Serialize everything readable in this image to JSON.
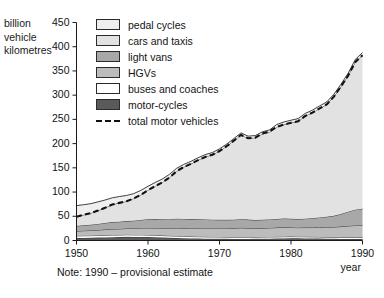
{
  "axis": {
    "y_label": "billion\nvehicle\nkilometres",
    "x_label": "year",
    "y_ticks": [
      "0",
      "50",
      "100",
      "150",
      "200",
      "250",
      "300",
      "350",
      "400",
      "450"
    ],
    "x_ticks": [
      "1950",
      "1960",
      "1970",
      "1980",
      "1990"
    ]
  },
  "note": "Note: 1990 – provisional estimate",
  "legend": {
    "items": [
      {
        "label": "pedal cycles",
        "color": "#efefef",
        "type": "swatch"
      },
      {
        "label": "cars and taxis",
        "color": "#e2e2e2",
        "type": "swatch"
      },
      {
        "label": "light vans",
        "color": "#a8a8a8",
        "type": "swatch"
      },
      {
        "label": "HGVs",
        "color": "#bcbcbc",
        "type": "swatch"
      },
      {
        "label": "buses and coaches",
        "color": "#ffffff",
        "type": "swatch"
      },
      {
        "label": "motor-cycles",
        "color": "#5a5a5a",
        "type": "swatch"
      },
      {
        "label": "total motor vehicles",
        "color": "#111111",
        "type": "dashed-line"
      }
    ]
  },
  "chart_data": {
    "type": "area",
    "title": "",
    "xlabel": "year",
    "ylabel": "billion vehicle kilometres",
    "xlim": [
      1950,
      1990
    ],
    "ylim": [
      0,
      450
    ],
    "grid": false,
    "legend_position": "top-left-inside",
    "stacking": "stacked-from-bottom",
    "stack_order_bottom_to_top": [
      "motor-cycles",
      "buses and coaches",
      "HGVs",
      "light vans",
      "cars and taxis",
      "pedal cycles"
    ],
    "x": [
      1950,
      1951,
      1952,
      1953,
      1954,
      1955,
      1956,
      1957,
      1958,
      1959,
      1960,
      1961,
      1962,
      1963,
      1964,
      1965,
      1966,
      1967,
      1968,
      1969,
      1970,
      1971,
      1972,
      1973,
      1974,
      1975,
      1976,
      1977,
      1978,
      1979,
      1980,
      1981,
      1982,
      1983,
      1984,
      1985,
      1986,
      1987,
      1988,
      1989,
      1990
    ],
    "series": [
      {
        "name": "motor-cycles",
        "color": "#5a5a5a",
        "values": [
          5.0,
          5.3,
          5.6,
          6.0,
          6.4,
          6.9,
          7.0,
          7.6,
          7.4,
          7.4,
          7.2,
          6.8,
          6.2,
          5.6,
          5.2,
          4.6,
          4.2,
          4.0,
          3.8,
          3.6,
          3.5,
          3.4,
          3.3,
          3.3,
          3.3,
          3.4,
          3.6,
          3.8,
          4.0,
          4.2,
          4.4,
          4.4,
          4.3,
          4.1,
          3.9,
          3.6,
          3.4,
          3.2,
          3.1,
          3.0,
          3.0
        ]
      },
      {
        "name": "buses and coaches",
        "color": "#ffffff",
        "values": [
          4.5,
          4.5,
          4.4,
          4.4,
          4.4,
          4.4,
          4.3,
          4.3,
          4.2,
          4.2,
          4.1,
          4.1,
          4.0,
          4.0,
          4.0,
          3.9,
          3.9,
          3.9,
          3.8,
          3.8,
          3.8,
          3.7,
          3.7,
          3.6,
          3.6,
          3.6,
          3.6,
          3.6,
          3.6,
          3.6,
          3.6,
          3.5,
          3.4,
          3.4,
          3.4,
          3.4,
          3.4,
          3.5,
          3.5,
          3.6,
          3.6
        ]
      },
      {
        "name": "HGVs",
        "color": "#bcbcbc",
        "values": [
          10.0,
          10.4,
          10.7,
          11.2,
          11.8,
          12.4,
          12.6,
          12.8,
          13.2,
          13.9,
          14.6,
          14.9,
          15.1,
          15.7,
          16.6,
          17.1,
          17.3,
          17.5,
          17.9,
          18.0,
          18.2,
          18.3,
          18.6,
          19.2,
          18.8,
          18.2,
          18.4,
          18.6,
          19.0,
          19.4,
          18.9,
          18.6,
          19.0,
          19.2,
          20.0,
          20.4,
          21.0,
          22.0,
          23.4,
          24.5,
          25.0
        ]
      },
      {
        "name": "light vans",
        "color": "#a8a8a8",
        "values": [
          10.5,
          11.2,
          11.8,
          12.6,
          13.5,
          14.4,
          14.8,
          15.3,
          16.0,
          17.0,
          18.0,
          18.4,
          18.6,
          18.8,
          19.2,
          19.0,
          18.8,
          18.4,
          18.0,
          17.6,
          17.2,
          17.2,
          17.4,
          17.8,
          17.4,
          17.0,
          17.2,
          17.4,
          17.8,
          18.2,
          18.0,
          17.8,
          18.4,
          19.2,
          20.4,
          21.6,
          23.2,
          26.0,
          29.5,
          32.5,
          34.0
        ]
      },
      {
        "name": "cars and taxis",
        "color": "#e2e2e2",
        "values": [
          19.0,
          21.5,
          24.0,
          27.5,
          31.5,
          36.0,
          39.0,
          41.0,
          46.0,
          52.0,
          60.0,
          68.0,
          76.0,
          86.0,
          98.0,
          107.0,
          114.0,
          122.0,
          129.0,
          134.0,
          142.0,
          152.0,
          163.0,
          174.0,
          168.0,
          170.0,
          177.0,
          180.0,
          190.0,
          194.0,
          198.0,
          202.0,
          212.0,
          218.0,
          225.0,
          232.0,
          246.0,
          263.0,
          281.0,
          305.0,
          317.0
        ]
      },
      {
        "name": "pedal cycles",
        "color": "#efefef",
        "values": [
          23.0,
          21.0,
          19.5,
          18.0,
          16.0,
          14.0,
          13.0,
          12.0,
          10.0,
          9.0,
          8.0,
          7.5,
          7.0,
          6.5,
          6.0,
          5.5,
          5.2,
          5.0,
          4.8,
          4.6,
          4.5,
          4.4,
          4.3,
          4.2,
          4.3,
          4.4,
          4.6,
          4.8,
          5.0,
          5.2,
          5.4,
          5.4,
          5.3,
          5.2,
          5.1,
          5.0,
          5.0,
          5.0,
          5.1,
          5.2,
          5.3
        ]
      }
    ],
    "overlay_line": {
      "name": "total motor vehicles",
      "style": "dashed",
      "color": "#111111",
      "values": [
        49.0,
        52.9,
        56.5,
        61.7,
        67.6,
        74.1,
        77.7,
        81.0,
        86.8,
        94.5,
        103.9,
        112.2,
        119.9,
        130.1,
        143.0,
        151.6,
        158.2,
        165.8,
        172.5,
        177.0,
        184.7,
        194.6,
        206.0,
        217.9,
        211.1,
        212.2,
        220.8,
        225.4,
        234.4,
        239.4,
        242.9,
        246.3,
        257.1,
        263.9,
        272.7,
        281.0,
        297.0,
        318.3,
        340.5,
        368.6,
        382.6
      ]
    }
  }
}
